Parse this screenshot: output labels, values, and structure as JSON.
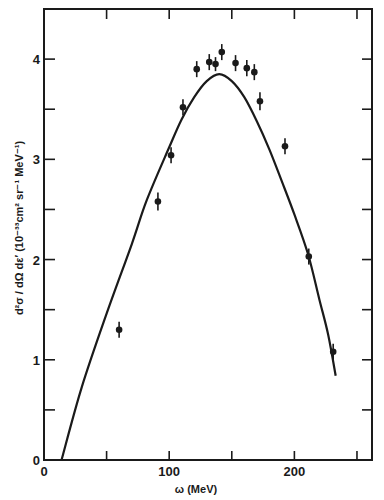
{
  "chart_data": {
    "type": "scatter",
    "title": "",
    "xlabel": "ω (MeV)",
    "ylabel": "d²σ / dΩ dε′   (10⁻³³cm² sr⁻¹ MeV⁻¹)",
    "xlim": [
      0,
      262
    ],
    "ylim": [
      0,
      4.5
    ],
    "x_major_ticks": [
      0,
      100,
      200
    ],
    "x_minor_ticks": [
      50,
      150,
      250
    ],
    "x_tick_labels": [
      "0",
      "100",
      "200"
    ],
    "y_major_ticks": [
      0,
      1,
      2,
      3,
      4
    ],
    "y_minor_ticks": [
      0.5,
      1.5,
      2.5,
      3.5
    ],
    "y_tick_labels": [
      "0",
      "1",
      "2",
      "3",
      "4"
    ],
    "grid": false,
    "legend": null,
    "series": [
      {
        "name": "data",
        "kind": "points-with-errorbars",
        "points": [
          {
            "x": 60,
            "y": 1.3,
            "err": 0.08
          },
          {
            "x": 91,
            "y": 2.58,
            "err": 0.09
          },
          {
            "x": 101.5,
            "y": 3.04,
            "err": 0.08
          },
          {
            "x": 111,
            "y": 3.52,
            "err": 0.08
          },
          {
            "x": 122,
            "y": 3.9,
            "err": 0.08
          },
          {
            "x": 132,
            "y": 3.97,
            "err": 0.08
          },
          {
            "x": 137,
            "y": 3.95,
            "err": 0.07
          },
          {
            "x": 142,
            "y": 4.07,
            "err": 0.08
          },
          {
            "x": 153,
            "y": 3.96,
            "err": 0.08
          },
          {
            "x": 162,
            "y": 3.91,
            "err": 0.08
          },
          {
            "x": 168,
            "y": 3.87,
            "err": 0.08
          },
          {
            "x": 172.5,
            "y": 3.58,
            "err": 0.09
          },
          {
            "x": 192.5,
            "y": 3.13,
            "err": 0.08
          },
          {
            "x": 211.5,
            "y": 2.03,
            "err": 0.08
          },
          {
            "x": 231,
            "y": 1.08,
            "err": 0.08
          }
        ]
      },
      {
        "name": "theory",
        "kind": "line",
        "points": [
          {
            "x": 14,
            "y": 0
          },
          {
            "x": 30,
            "y": 0.72
          },
          {
            "x": 50,
            "y": 1.46
          },
          {
            "x": 70,
            "y": 2.15
          },
          {
            "x": 82,
            "y": 2.59
          },
          {
            "x": 100,
            "y": 3.12
          },
          {
            "x": 110,
            "y": 3.4
          },
          {
            "x": 120,
            "y": 3.62
          },
          {
            "x": 130,
            "y": 3.78
          },
          {
            "x": 140,
            "y": 3.85
          },
          {
            "x": 150,
            "y": 3.78
          },
          {
            "x": 160,
            "y": 3.62
          },
          {
            "x": 170,
            "y": 3.38
          },
          {
            "x": 180,
            "y": 3.1
          },
          {
            "x": 190,
            "y": 2.78
          },
          {
            "x": 200,
            "y": 2.45
          },
          {
            "x": 211,
            "y": 2.05
          },
          {
            "x": 220,
            "y": 1.6
          },
          {
            "x": 227,
            "y": 1.25
          },
          {
            "x": 233,
            "y": 0.84
          }
        ]
      }
    ],
    "colors": {
      "ink": "#1a1a1a",
      "background": "#ffffff"
    }
  }
}
